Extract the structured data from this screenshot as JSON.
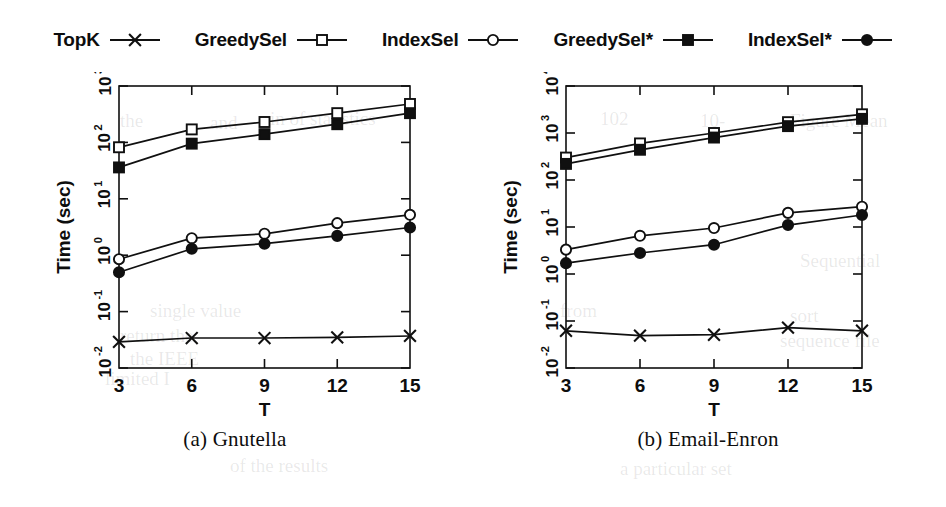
{
  "figure": {
    "legend": {
      "entries": [
        {
          "label": "TopK",
          "marker": "cross-marker"
        },
        {
          "label": "GreedySel",
          "marker": "open-square-marker"
        },
        {
          "label": "IndexSel",
          "marker": "open-circle-marker"
        },
        {
          "label": "GreedySel*",
          "marker": "filled-square-marker"
        },
        {
          "label": "IndexSel*",
          "marker": "filled-circle-marker"
        }
      ]
    },
    "panels": [
      {
        "id": "a",
        "caption": "(a) Gnutella"
      },
      {
        "id": "b",
        "caption": "(b) Email-Enron"
      }
    ],
    "ghost_text": [
      {
        "text": "the",
        "x": 120,
        "y": 110
      },
      {
        "text": "and",
        "x": 210,
        "y": 112
      },
      {
        "text": "in of statistics",
        "x": 270,
        "y": 108
      },
      {
        "text": "102",
        "x": 600,
        "y": 108
      },
      {
        "text": "10-",
        "x": 700,
        "y": 110
      },
      {
        "text": "single value",
        "x": 150,
        "y": 300
      },
      {
        "text": "return the",
        "x": 120,
        "y": 325
      },
      {
        "text": "the    IEEE",
        "x": 130,
        "y": 348
      },
      {
        "text": "limited  I",
        "x": 105,
        "y": 368
      },
      {
        "text": "from",
        "x": 560,
        "y": 300
      },
      {
        "text": "Figure Mean",
        "x": 790,
        "y": 110
      },
      {
        "text": "Sequential",
        "x": 800,
        "y": 250
      },
      {
        "text": "sort",
        "x": 790,
        "y": 305
      },
      {
        "text": "sequence file",
        "x": 780,
        "y": 330
      },
      {
        "text": "of  the  results",
        "x": 230,
        "y": 455
      },
      {
        "text": "a particular  set",
        "x": 620,
        "y": 458
      }
    ]
  },
  "chart_data": [
    {
      "type": "line",
      "panel": "a",
      "title": "(a) Gnutella",
      "xlabel": "T",
      "ylabel": "Time (sec)",
      "x": [
        3,
        6,
        9,
        12,
        15
      ],
      "xtick_labels": [
        "3",
        "6",
        "9",
        "12",
        "15"
      ],
      "yscale": "log",
      "ylim": [
        0.01,
        1000
      ],
      "ytick_labels": [
        "10-2",
        "10-1",
        "100",
        "101",
        "102",
        "103"
      ],
      "ytick_mantissa": [
        "10",
        "10",
        "10",
        "10",
        "10",
        "10"
      ],
      "ytick_exponent": [
        "-2",
        "-1",
        "0",
        "1",
        "2",
        "3"
      ],
      "ytick_values": [
        0.01,
        0.1,
        1,
        10,
        100,
        1000
      ],
      "grid": false,
      "legend_position": "above-figure",
      "series": [
        {
          "name": "TopK",
          "marker": "cross-marker",
          "values": [
            0.029,
            0.034,
            0.034,
            0.035,
            0.037
          ]
        },
        {
          "name": "GreedySel",
          "marker": "open-square-marker",
          "values": [
            82,
            170,
            230,
            330,
            480
          ]
        },
        {
          "name": "IndexSel",
          "marker": "open-circle-marker",
          "values": [
            0.85,
            2.0,
            2.4,
            3.7,
            5.2
          ]
        },
        {
          "name": "GreedySel*",
          "marker": "filled-square-marker",
          "values": [
            36,
            95,
            140,
            210,
            330
          ]
        },
        {
          "name": "IndexSel*",
          "marker": "filled-circle-marker",
          "values": [
            0.5,
            1.3,
            1.6,
            2.2,
            3.1
          ]
        }
      ]
    },
    {
      "type": "line",
      "panel": "b",
      "title": "(b) Email-Enron",
      "xlabel": "T",
      "ylabel": "Time (sec)",
      "x": [
        3,
        6,
        9,
        12,
        15
      ],
      "xtick_labels": [
        "3",
        "6",
        "9",
        "12",
        "15"
      ],
      "yscale": "log",
      "ylim": [
        0.01,
        10000
      ],
      "ytick_labels": [
        "10-2",
        "10-1",
        "100",
        "101",
        "102",
        "103",
        "104"
      ],
      "ytick_mantissa": [
        "10",
        "10",
        "10",
        "10",
        "10",
        "10",
        "10"
      ],
      "ytick_exponent": [
        "-2",
        "-1",
        "0",
        "1",
        "2",
        "3",
        "4"
      ],
      "ytick_values": [
        0.01,
        0.1,
        1,
        10,
        100,
        1000,
        10000
      ],
      "grid": false,
      "legend_position": "above-figure",
      "series": [
        {
          "name": "TopK",
          "marker": "cross-marker",
          "values": [
            0.062,
            0.049,
            0.051,
            0.072,
            0.062
          ]
        },
        {
          "name": "GreedySel",
          "marker": "open-square-marker",
          "values": [
            300,
            600,
            1000,
            1700,
            2500
          ]
        },
        {
          "name": "IndexSel",
          "marker": "open-circle-marker",
          "values": [
            3.3,
            6.5,
            9.5,
            20,
            27
          ]
        },
        {
          "name": "GreedySel*",
          "marker": "filled-square-marker",
          "values": [
            220,
            440,
            800,
            1400,
            2000
          ]
        },
        {
          "name": "IndexSel*",
          "marker": "filled-circle-marker",
          "values": [
            1.7,
            2.8,
            4.2,
            11,
            18
          ]
        }
      ]
    }
  ]
}
